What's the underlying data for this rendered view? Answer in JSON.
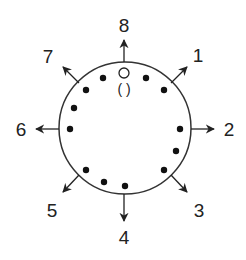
{
  "diagram": {
    "title": "",
    "circle": {
      "cx": 125,
      "cy": 128,
      "r": 66,
      "stroke": "#333333"
    },
    "marker": {
      "label": "( )",
      "open_dot": {
        "x": 124,
        "y": 73
      }
    },
    "directions": [
      {
        "label": "1",
        "from": [
          171,
          83
        ],
        "to": [
          187,
          67
        ],
        "text": [
          198,
          62
        ]
      },
      {
        "label": "2",
        "from": [
          191,
          129
        ],
        "to": [
          214,
          129
        ],
        "text": [
          229,
          136
        ]
      },
      {
        "label": "3",
        "from": [
          171,
          175
        ],
        "to": [
          187,
          192
        ],
        "text": [
          199,
          217
        ]
      },
      {
        "label": "4",
        "from": [
          124,
          194
        ],
        "to": [
          124,
          221
        ],
        "text": [
          124,
          244
        ]
      },
      {
        "label": "5",
        "from": [
          79,
          175
        ],
        "to": [
          63,
          192
        ],
        "text": [
          52,
          217
        ]
      },
      {
        "label": "6",
        "from": [
          59,
          129
        ],
        "to": [
          36,
          129
        ],
        "text": [
          21,
          136
        ]
      },
      {
        "label": "7",
        "from": [
          79,
          83
        ],
        "to": [
          63,
          67
        ],
        "text": [
          48,
          63
        ]
      },
      {
        "label": "8",
        "from": [
          124,
          62
        ],
        "to": [
          124,
          40
        ],
        "text": [
          124,
          32
        ]
      }
    ],
    "dots": [
      [
        103,
        78
      ],
      [
        146,
        78
      ],
      [
        86,
        90
      ],
      [
        164,
        90
      ],
      [
        74,
        108
      ],
      [
        70,
        129
      ],
      [
        180,
        129
      ],
      [
        176,
        151
      ],
      [
        86,
        170
      ],
      [
        164,
        170
      ],
      [
        104,
        182
      ],
      [
        125,
        186
      ]
    ]
  }
}
